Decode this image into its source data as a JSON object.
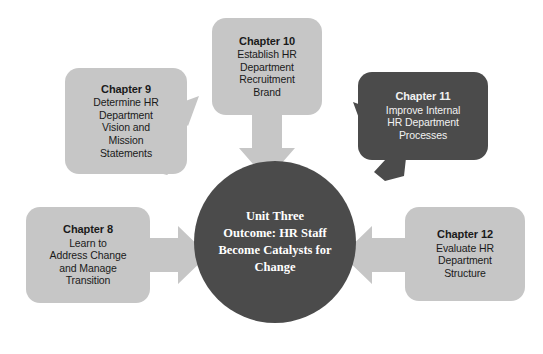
{
  "diagram": {
    "type": "hub-and-spoke",
    "colors": {
      "box_light": "#c6c6c6",
      "box_dark": "#4b4b4b",
      "circle": "#4b4b4b",
      "arrow_light": "#c6c6c6",
      "arrow_dark": "#4b4b4b",
      "text_dark": "#1a1a1a",
      "text_light": "#f2f2f2",
      "background": "#ffffff"
    },
    "center": {
      "label": "Unit Three Outcome: HR Staff Become Catalysts for Change",
      "lines": [
        "Unit Three",
        "Outcome: HR Staff",
        "Become Catalysts for",
        "Change"
      ]
    },
    "nodes": [
      {
        "id": "ch8",
        "title": "Chapter 8",
        "lines": [
          "Learn to",
          "Address Change",
          "and Manage",
          "Transition"
        ],
        "theme": "light",
        "arrow_direction": "right"
      },
      {
        "id": "ch9",
        "title": "Chapter 9",
        "lines": [
          "Determine HR",
          "Department",
          "Vision and",
          "Mission",
          "Statements"
        ],
        "theme": "light",
        "arrow_direction": "down-right"
      },
      {
        "id": "ch10",
        "title": "Chapter 10",
        "lines": [
          "Establish HR",
          "Department",
          "Recruitment",
          "Brand"
        ],
        "theme": "light",
        "arrow_direction": "down"
      },
      {
        "id": "ch11",
        "title": "Chapter 11",
        "lines": [
          "Improve Internal",
          "HR Department",
          "Processes"
        ],
        "theme": "dark",
        "arrow_direction": "down-left"
      },
      {
        "id": "ch12",
        "title": "Chapter 12",
        "lines": [
          "Evaluate HR",
          "Department",
          "Structure"
        ],
        "theme": "light",
        "arrow_direction": "left"
      }
    ]
  }
}
